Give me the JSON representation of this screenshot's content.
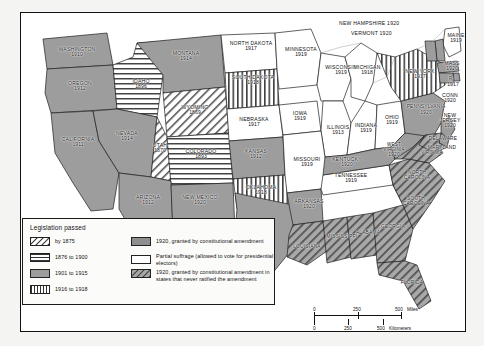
{
  "map": {
    "legend": {
      "title": "Legislation passed",
      "items_left": [
        {
          "swatch": "diagonal-hatch",
          "label": "by 1875"
        },
        {
          "swatch": "horizontal-lines",
          "label": "1876 to 1900"
        },
        {
          "swatch": "solid-gray",
          "label": "1901 to 1915"
        },
        {
          "swatch": "vertical-lines",
          "label": "1916 to 1918"
        }
      ],
      "items_right": [
        {
          "swatch": "solid-gray",
          "label": "1920, granted by constitutional amendment"
        },
        {
          "swatch": "white",
          "label": "Partial suffrage (allowed to vote for presidential electors)"
        },
        {
          "swatch": "gray-diagonal-hatch",
          "label": "1920, granted by constitutional amendment in states that never ratified the amendment"
        }
      ]
    },
    "scale": {
      "miles": {
        "ticks": [
          "0",
          "250",
          "500"
        ],
        "unit": "Miles"
      },
      "kilometers": {
        "ticks": [
          "0",
          "250",
          "500"
        ],
        "unit": "Kilometers"
      }
    },
    "states": [
      {
        "name": "WASHINGTON",
        "year": "1910",
        "fill": "solid-gray"
      },
      {
        "name": "OREGON",
        "year": "1912",
        "fill": "solid-gray"
      },
      {
        "name": "IDAHO",
        "year": "1896",
        "fill": "horizontal-lines"
      },
      {
        "name": "MONTANA",
        "year": "1914",
        "fill": "solid-gray"
      },
      {
        "name": "WYOMING",
        "year": "1869",
        "fill": "diagonal-hatch"
      },
      {
        "name": "NEVADA",
        "year": "1914",
        "fill": "solid-gray"
      },
      {
        "name": "UTAH",
        "year": "1870",
        "fill": "diagonal-hatch"
      },
      {
        "name": "COLORADO",
        "year": "1893",
        "fill": "horizontal-lines"
      },
      {
        "name": "CALIFORNIA",
        "year": "1911",
        "fill": "solid-gray"
      },
      {
        "name": "ARIZONA",
        "year": "1912",
        "fill": "solid-gray"
      },
      {
        "name": "NEW MEXICO",
        "year": "1920",
        "fill": "solid-gray"
      },
      {
        "name": "NORTH DAKOTA",
        "year": "1917",
        "fill": "white"
      },
      {
        "name": "SOUTH DAKOTA",
        "year": "1918",
        "fill": "vertical-lines"
      },
      {
        "name": "NEBRASKA",
        "year": "1917",
        "fill": "white"
      },
      {
        "name": "KANSAS",
        "year": "1912",
        "fill": "solid-gray"
      },
      {
        "name": "OKLAHOMA",
        "year": "1918",
        "fill": "vertical-lines"
      },
      {
        "name": "TEXAS",
        "year": "1920",
        "fill": "solid-gray"
      },
      {
        "name": "MINNESOTA",
        "year": "1919",
        "fill": "white"
      },
      {
        "name": "IOWA",
        "year": "1919",
        "fill": "white"
      },
      {
        "name": "MISSOURI",
        "year": "1919",
        "fill": "white"
      },
      {
        "name": "ARKANSAS",
        "year": "1920",
        "fill": "solid-gray"
      },
      {
        "name": "LOUISIANA",
        "year": "",
        "fill": "gray-diagonal-hatch"
      },
      {
        "name": "WISCONSIN",
        "year": "1919",
        "fill": "white"
      },
      {
        "name": "ILLINOIS",
        "year": "1913",
        "fill": "white"
      },
      {
        "name": "MICHIGAN",
        "year": "1918",
        "fill": "white"
      },
      {
        "name": "INDIANA",
        "year": "1919",
        "fill": "white"
      },
      {
        "name": "OHIO",
        "year": "1919",
        "fill": "white"
      },
      {
        "name": "KENTUCKY",
        "year": "1920",
        "fill": "solid-gray"
      },
      {
        "name": "TENNESSEE",
        "year": "1919",
        "fill": "white"
      },
      {
        "name": "MISSISSIPPI",
        "year": "",
        "fill": "gray-diagonal-hatch"
      },
      {
        "name": "ALABAMA",
        "year": "",
        "fill": "gray-diagonal-hatch"
      },
      {
        "name": "GEORGIA",
        "year": "",
        "fill": "gray-diagonal-hatch"
      },
      {
        "name": "FLORIDA",
        "year": "",
        "fill": "gray-diagonal-hatch"
      },
      {
        "name": "SOUTH CAROLINA",
        "year": "",
        "fill": "gray-diagonal-hatch"
      },
      {
        "name": "NORTH CAROLINA",
        "year": "",
        "fill": "gray-diagonal-hatch"
      },
      {
        "name": "VIRGINIA",
        "year": "",
        "fill": "gray-diagonal-hatch"
      },
      {
        "name": "WEST VIRGINIA",
        "year": "1920",
        "fill": "solid-gray"
      },
      {
        "name": "PENNSYLVANIA",
        "year": "1920",
        "fill": "solid-gray"
      },
      {
        "name": "NEW YORK",
        "year": "1917",
        "fill": "vertical-lines"
      },
      {
        "name": "MAINE",
        "year": "1919",
        "fill": "white"
      },
      {
        "name": "NEW HAMPSHIRE",
        "year": "1920",
        "fill": "solid-gray"
      },
      {
        "name": "VERMONT",
        "year": "1920",
        "fill": "solid-gray"
      },
      {
        "name": "MASS",
        "year": "1920",
        "fill": "solid-gray"
      },
      {
        "name": "R.I.",
        "year": "1917",
        "fill": "solid-gray"
      },
      {
        "name": "CONN",
        "year": "1920",
        "fill": "solid-gray"
      },
      {
        "name": "NEW JERSEY",
        "year": "1920",
        "fill": "solid-gray"
      },
      {
        "name": "DELAWARE",
        "year": "",
        "fill": "solid-gray"
      },
      {
        "name": "MARYLAND",
        "year": "",
        "fill": "gray-diagonal-hatch"
      }
    ],
    "labels": {
      "washington": "WASHINGTON",
      "washington_yr": "1910",
      "oregon": "OREGON",
      "oregon_yr": "1912",
      "idaho": "IDAHO",
      "idaho_yr": "1896",
      "montana": "MONTANA",
      "montana_yr": "1914",
      "wyoming": "WYOMING",
      "wyoming_yr": "1869",
      "nevada": "NEVADA",
      "nevada_yr": "1914",
      "utah": "UTAH",
      "utah_yr": "1870",
      "colorado": "COLORADO",
      "colorado_yr": "1893",
      "california": "CALIFORNIA",
      "california_yr": "1911",
      "arizona": "ARIZONA",
      "arizona_yr": "1912",
      "newmexico": "NEW MEXICO",
      "newmexico_yr": "1920",
      "northdakota": "NORTH DAKOTA",
      "northdakota_yr": "1917",
      "southdakota": "SOUTH DAKOTA",
      "southdakota_yr": "1918",
      "nebraska": "NEBRASKA",
      "nebraska_yr": "1917",
      "kansas": "KANSAS",
      "kansas_yr": "1912",
      "oklahoma": "OKLAHOMA",
      "oklahoma_yr": "1918",
      "texas": "TEXAS",
      "texas_yr": "1920",
      "minnesota": "MINNESOTA",
      "minnesota_yr": "1919",
      "iowa": "IOWA",
      "iowa_yr": "1919",
      "missouri": "MISSOURI",
      "missouri_yr": "1919",
      "arkansas": "ARKANSAS",
      "arkansas_yr": "1920",
      "louisiana": "LOUISIANA",
      "wisconsin": "WISCONSIN",
      "wisconsin_yr": "1919",
      "illinois": "ILLINOIS",
      "illinois_yr": "1913",
      "michigan": "MICHIGAN",
      "michigan_yr": "1918",
      "indiana": "INDIANA",
      "indiana_yr": "1919",
      "ohio": "OHIO",
      "ohio_yr": "1919",
      "kentucky": "KENTUCKY",
      "kentucky_yr": "1920",
      "tennessee": "TENNESSEE",
      "tennessee_yr": "1919",
      "mississippi": "MISSISSIPPI",
      "alabama": "ALABAMA",
      "georgia": "GEORGIA",
      "florida": "FLORIDA",
      "southcarolina": "SOUTH CAROLINA",
      "northcarolina": "NORTH CAROLINA",
      "virginia": "VIRGINIA",
      "westvirginia": "WEST VIRGINIA",
      "westvirginia_yr": "1920",
      "pennsylvania": "PENNSYLVANIA",
      "pennsylvania_yr": "1920",
      "newyork": "NEW YORK",
      "newyork_yr": "1917",
      "maine": "MAINE",
      "maine_yr": "1919",
      "newhampshire": "NEW HAMPSHIRE 1920",
      "vermont": "VERMONT 1920",
      "mass": "MASS",
      "mass_yr": "1920",
      "ri": "R.I.",
      "ri_yr": "1917",
      "conn": "CONN",
      "conn_yr": "1920",
      "newjersey": "NEW JERSEY",
      "newjersey_yr": "1920",
      "delaware": "DELAWARE",
      "maryland": "MARYLAND"
    }
  }
}
